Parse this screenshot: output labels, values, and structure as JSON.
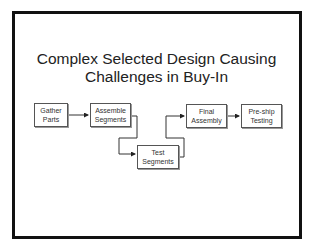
{
  "slide": {
    "title_line1": "Complex Selected Design Causing",
    "title_line2": "Challenges in Buy-In"
  },
  "steps": [
    {
      "id": "gather-parts",
      "line1": "Gather",
      "line2": "Parts"
    },
    {
      "id": "assemble-segments",
      "line1": "Assemble",
      "line2": "Segments"
    },
    {
      "id": "test-segments",
      "line1": "Test",
      "line2": "Segments"
    },
    {
      "id": "final-assembly",
      "line1": "Final",
      "line2": "Assembly"
    },
    {
      "id": "pre-ship-testing",
      "line1": "Pre-ship",
      "line2": "Testing"
    }
  ],
  "colors": {
    "border": "#111111",
    "box_border": "#555555",
    "text": "#222222"
  }
}
